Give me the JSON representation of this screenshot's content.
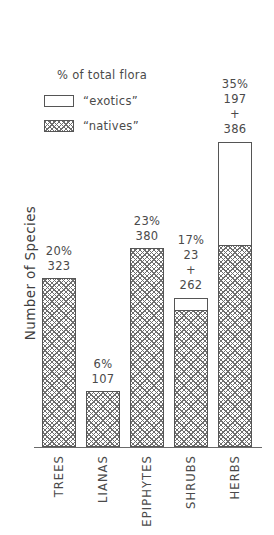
{
  "chart_data": {
    "type": "bar",
    "subtype": "stacked-bar",
    "title": "",
    "xlabel": "",
    "ylabel": "Number of Species",
    "categories": [
      "TREES",
      "LIANAS",
      "EPIPHYTES",
      "SHRUBS",
      "HERBS"
    ],
    "series": [
      {
        "name": "“natives”",
        "values": [
          323,
          107,
          380,
          262,
          386
        ]
      },
      {
        "name": "“exotics”",
        "values": [
          0,
          0,
          0,
          23,
          197
        ]
      }
    ],
    "totals": [
      323,
      107,
      380,
      285,
      583
    ],
    "percent_of_total_flora": [
      "20%",
      "6%",
      "23%",
      "17%",
      "35%"
    ],
    "ylim": [
      0,
      690
    ],
    "grid": false,
    "legend_position": "upper-left",
    "legend_title": "% of total flora",
    "axis_ticks": []
  },
  "legend": {
    "title": "% of total flora",
    "items": [
      {
        "label": "“exotics”",
        "swatch": "plain"
      },
      {
        "label": "“natives”",
        "swatch": "hatch"
      }
    ]
  },
  "axis": {
    "y_title": "Number of Species"
  },
  "bars": [
    {
      "category": "TREES",
      "percent": "20%",
      "value_lines": [
        "20%",
        "323"
      ],
      "natives": 323,
      "exotics": 0,
      "total": 323
    },
    {
      "category": "LIANAS",
      "percent": "6%",
      "value_lines": [
        "6%",
        "107"
      ],
      "natives": 107,
      "exotics": 0,
      "total": 107
    },
    {
      "category": "EPIPHYTES",
      "percent": "23%",
      "value_lines": [
        "23%",
        "380"
      ],
      "natives": 380,
      "exotics": 0,
      "total": 380
    },
    {
      "category": "SHRUBS",
      "percent": "17%",
      "value_lines": [
        "17%",
        "23",
        "+",
        "262"
      ],
      "natives": 262,
      "exotics": 23,
      "total": 285
    },
    {
      "category": "HERBS",
      "percent": "35%",
      "value_lines": [
        "35%",
        "197",
        "+",
        "386"
      ],
      "natives": 386,
      "exotics": 197,
      "total": 583
    }
  ],
  "footer": {
    "caption": ""
  },
  "colors": {
    "background": "#ffffff",
    "ink": "#4a4a4a",
    "line": "#555555",
    "hatch": "#6e6e6e"
  }
}
